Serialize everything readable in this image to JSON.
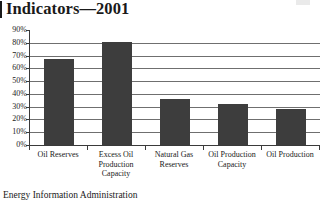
{
  "title": {
    "text": "Indicators—2001"
  },
  "source": {
    "text": "Energy Information Administration"
  },
  "colors": {
    "bar": "#3d3d3d",
    "gridline": "#6f6f6f",
    "axis": "#3a3a3a",
    "text": "#1a1a1a",
    "background": "#ffffff"
  },
  "chart_data": {
    "type": "bar",
    "title": "Indicators—2001",
    "xlabel": "",
    "ylabel": "",
    "ylim": [
      0,
      90
    ],
    "ytick_step": 10,
    "ytick_labels": [
      "90%",
      "80%",
      "70%",
      "60%",
      "50%",
      "40%",
      "30%",
      "20%",
      "10%",
      "0%"
    ],
    "ytick_values": [
      90,
      80,
      70,
      60,
      50,
      40,
      30,
      20,
      10,
      0
    ],
    "grid": true,
    "grid_axis": "y",
    "legend": false,
    "legend_position": "none",
    "categories": [
      "Oil Reserves",
      "Excess Oil Production Capacity",
      "Natural Gas Reserves",
      "Oil Production Capacity",
      "Oil Production"
    ],
    "values": [
      67,
      81,
      36,
      32,
      28
    ],
    "value_suffix": "%",
    "data_labels": false
  }
}
